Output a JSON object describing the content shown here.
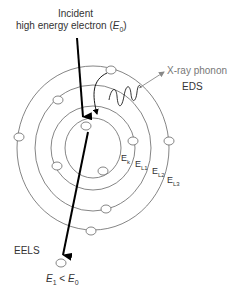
{
  "title": {
    "line1": "Incident",
    "line2_prefix": "high energy electron (",
    "line2_var": "E",
    "line2_sub": "0",
    "line2_suffix": ")"
  },
  "xray": {
    "label": "X-ray phonon",
    "technique": "EDS"
  },
  "shells": [
    {
      "label": "E",
      "sub": "k"
    },
    {
      "label": "E",
      "sub": "L1"
    },
    {
      "label": "E",
      "sub": "L2"
    },
    {
      "label": "E",
      "sub": "L3"
    }
  ],
  "eels": {
    "label": "EELS",
    "relation_var1": "E",
    "relation_sub1": "1",
    "relation_op": " < ",
    "relation_var2": "E",
    "relation_sub2": "0"
  },
  "colors": {
    "line": "#555555",
    "beam": "#000000",
    "xray": "#888888",
    "text": "#333333"
  }
}
